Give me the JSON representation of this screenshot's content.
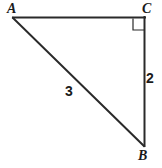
{
  "figure": {
    "type": "right-triangle-diagram",
    "background_color": "#ffffff",
    "stroke_color": "#2a2a2a",
    "label_color": "#1a1a1a",
    "vertices": {
      "A": {
        "label": "A",
        "x": 13,
        "y": 18
      },
      "C": {
        "label": "C",
        "x": 145,
        "y": 18
      },
      "B": {
        "label": "B",
        "x": 144,
        "y": 146
      }
    },
    "sides": {
      "AC": {
        "label": "",
        "from": "A",
        "to": "C"
      },
      "CB": {
        "label": "2",
        "from": "C",
        "to": "B"
      },
      "AB": {
        "label": "3",
        "from": "A",
        "to": "B"
      }
    },
    "right_angle": {
      "at_vertex": "C",
      "marker": "square",
      "size": 12
    }
  }
}
